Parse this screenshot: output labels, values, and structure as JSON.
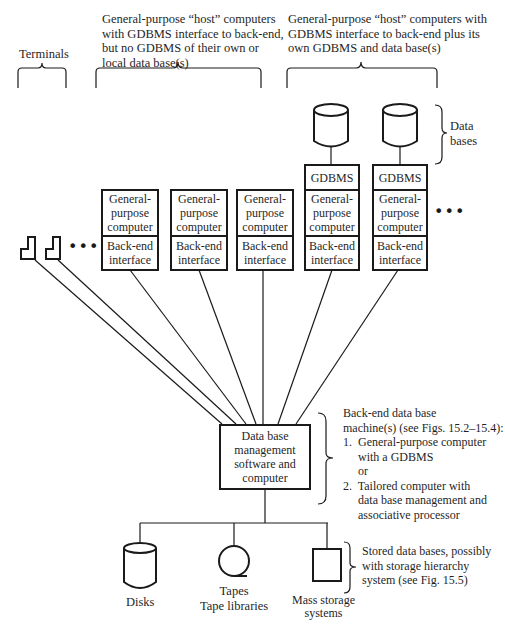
{
  "groups": {
    "terminals": {
      "label": "Terminals"
    },
    "hosts_no_gdbms": {
      "label": "General-purpose “host” computers\nwith GDBMS interface to back-end,\nbut no GDBMS of their own or\nlocal data base(s)"
    },
    "hosts_with_gdbms": {
      "label": "General-purpose “host” computers with\nGDBMS interface to back-end plus its\nown GDBMS and data base(s)"
    },
    "data_bases": {
      "label": "Data\nbases"
    }
  },
  "host_boxes": [
    {
      "gdbms": null,
      "computer": "General-\npurpose\ncomputer",
      "interface": "Back-end\ninterface"
    },
    {
      "gdbms": null,
      "computer": "General-\npurpose\ncomputer",
      "interface": "Back-end\ninterface"
    },
    {
      "gdbms": null,
      "computer": "General-\npurpose\ncomputer",
      "interface": "Back-end\ninterface"
    },
    {
      "gdbms": "GDBMS",
      "computer": "General-\npurpose\ncomputer",
      "interface": "Back-end\ninterface"
    },
    {
      "gdbms": "GDBMS",
      "computer": "General-\npurpose\ncomputer",
      "interface": "Back-end\ninterface"
    }
  ],
  "ellipsis": "•••",
  "backend": {
    "box_label": "Data base\nmanagement\nsoftware and\ncomputer",
    "description": "Back-end data base\nmachine(s) (see Figs. 15.2–15.4):\n1.  General-purpose computer\n     with a GDBMS\n     or\n2.  Tailored computer with\n     data base management and\n     associative processor"
  },
  "storage": {
    "disks": "Disks",
    "tapes": "Tapes\nTape libraries",
    "mass": "Mass storage\nsystems",
    "description": "Stored data bases, possibly\nwith storage hierarchy\nsystem (see Fig. 15.5)"
  }
}
